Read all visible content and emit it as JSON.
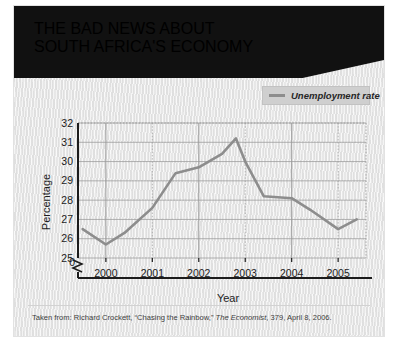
{
  "title": {
    "line1": "THE BAD NEWS ABOUT",
    "line2": "SOUTH AFRICA'S ECONOMY"
  },
  "legend": {
    "label": "Unemployment rate",
    "swatch_color": "#8d8d8d"
  },
  "footnote": {
    "prefix": "Taken from: Richard Crockett, “Chasing the Rainbow,” ",
    "source_italic": "The Economist",
    "suffix": ", 379, April 8, 2006."
  },
  "colors": {
    "banner": "#111111",
    "line": "#8d8d8d",
    "grid": "#9a9a9a",
    "axis": "#1c1c1c",
    "panel": "#eeeeee"
  },
  "chart_data": {
    "type": "line",
    "title": "THE BAD NEWS ABOUT SOUTH AFRICA'S ECONOMY",
    "xlabel": "Year",
    "ylabel": "Percentage",
    "xlim": [
      1999.4,
      2005.6
    ],
    "ylim": [
      25,
      32
    ],
    "yticks": [
      25,
      26,
      27,
      28,
      29,
      30,
      31,
      32
    ],
    "ytick_labels": [
      "25",
      "26",
      "27",
      "28",
      "29",
      "30",
      "31",
      "32"
    ],
    "y_axis_break_label": "0",
    "xticks": [
      2000,
      2001,
      2002,
      2003,
      2004,
      2005
    ],
    "xtick_labels": [
      "2000",
      "2001",
      "2002",
      "2003",
      "2004",
      "2005"
    ],
    "grid": true,
    "legend_position": "top-right",
    "series": [
      {
        "name": "Unemployment rate",
        "color": "#8d8d8d",
        "x": [
          1999.5,
          2000.0,
          2000.4,
          2001.0,
          2001.5,
          2002.0,
          2002.5,
          2002.8,
          2003.0,
          2003.4,
          2004.0,
          2004.4,
          2005.0,
          2005.4
        ],
        "values": [
          26.5,
          25.7,
          26.3,
          27.6,
          29.4,
          29.7,
          30.4,
          31.2,
          30.0,
          28.2,
          28.1,
          27.5,
          26.5,
          27.0
        ]
      }
    ]
  }
}
